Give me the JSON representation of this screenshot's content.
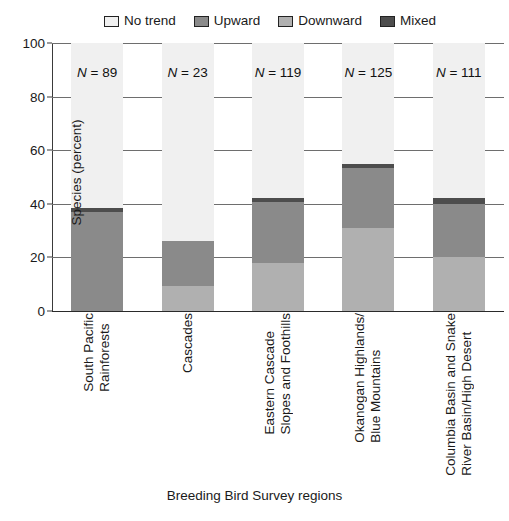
{
  "chart_data": {
    "type": "bar",
    "subtype": "stacked-bar-percent",
    "title": "",
    "xlabel": "Breeding Bird Survey regions",
    "ylabel": "Species (percent)",
    "ylim": [
      0,
      100
    ],
    "yticks": [
      0,
      20,
      40,
      60,
      80,
      100
    ],
    "ytick_labels": [
      "0",
      "20",
      "40",
      "60",
      "80",
      "100"
    ],
    "grid": "horizontal",
    "legend_position": "top",
    "categories": [
      "South Pacific Rainforests",
      "Cascades",
      "Eastern Cascade Slopes and Foothills",
      "Okanogan Highlands/Blue Mountains",
      "Columbia Basin and Snake River Basin/High Desert"
    ],
    "category_label_lines": [
      [
        "South Pacific",
        "Rainforests"
      ],
      [
        "Cascades"
      ],
      [
        "Eastern Cascade",
        "Slopes and Foothills"
      ],
      [
        "Okanogan Highlands/",
        "Blue Mountains"
      ],
      [
        "Columbia Basin and Snake",
        "River Basin/High Desert"
      ]
    ],
    "series": [
      {
        "name": "Downward",
        "color": "#b0b0b0",
        "values": [
          0,
          9.5,
          18,
          31,
          20
        ]
      },
      {
        "name": "Upward",
        "color": "#8a8a8a",
        "values": [
          37,
          16.5,
          22.5,
          22.5,
          20
        ]
      },
      {
        "name": "Mixed",
        "color": "#4d4d4d",
        "values": [
          1.5,
          0,
          1.5,
          1.5,
          2
        ]
      },
      {
        "name": "No trend",
        "color": "#f0f0f0",
        "values": [
          61.5,
          74,
          58,
          45,
          58
        ]
      }
    ],
    "stack_order_bottom_to_top": [
      "Downward",
      "Upward",
      "Mixed",
      "No trend"
    ],
    "bar_totals_colored": [
      38.5,
      26,
      42,
      55,
      42
    ],
    "annotations": [
      {
        "text": "N = 89",
        "category": "South Pacific Rainforests",
        "value": 89
      },
      {
        "text": "N = 23",
        "category": "Cascades",
        "value": 23
      },
      {
        "text": "N = 119",
        "category": "Eastern Cascade Slopes and Foothills",
        "value": 119
      },
      {
        "text": "N = 125",
        "category": "Okanogan Highlands/Blue Mountains",
        "value": 125
      },
      {
        "text": "N = 111",
        "category": "Columbia Basin and Snake River Basin/High Desert",
        "value": 111
      }
    ]
  },
  "legend": {
    "items": [
      {
        "label": "No trend",
        "color": "#f0f0f0"
      },
      {
        "label": "Upward",
        "color": "#8a8a8a"
      },
      {
        "label": "Downward",
        "color": "#b0b0b0"
      },
      {
        "label": "Mixed",
        "color": "#4d4d4d"
      }
    ]
  },
  "axes": {
    "y_title": "Species (percent)",
    "x_title": "Breeding Bird Survey regions",
    "y_ticks": [
      "100",
      "80",
      "60",
      "40",
      "20",
      "0"
    ]
  },
  "n_labels": {
    "prefix": "N",
    "separator": " = ",
    "values": [
      "89",
      "23",
      "119",
      "125",
      "111"
    ]
  },
  "colors": {
    "no_trend": "#f0f0f0",
    "upward": "#8a8a8a",
    "downward": "#b0b0b0",
    "mixed": "#4d4d4d",
    "axis": "#2a2a2a",
    "gridline": "#6e6e6e",
    "text": "#1a1a1a"
  }
}
